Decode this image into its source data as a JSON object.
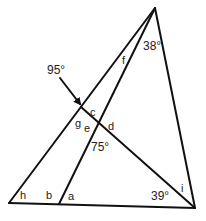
{
  "diagram": {
    "type": "geometry-angles",
    "angles_given": {
      "apex_inner": "38°",
      "arrow_angle": "95°",
      "intersection_lower": "75°",
      "bottom_right": "39°"
    },
    "unknown_labels": [
      "a",
      "b",
      "c",
      "d",
      "e",
      "f",
      "g",
      "h",
      "i"
    ],
    "labels": {
      "a": "a",
      "b": "b",
      "c": "c",
      "d": "d",
      "e": "e",
      "f": "f",
      "g": "g",
      "h": "h",
      "i": "i",
      "deg38": "38°",
      "deg95": "95°",
      "deg75": "75°",
      "deg39": "39°"
    },
    "colors": {
      "line": "#111111",
      "text": "#222222",
      "background": "#ffffff"
    }
  }
}
